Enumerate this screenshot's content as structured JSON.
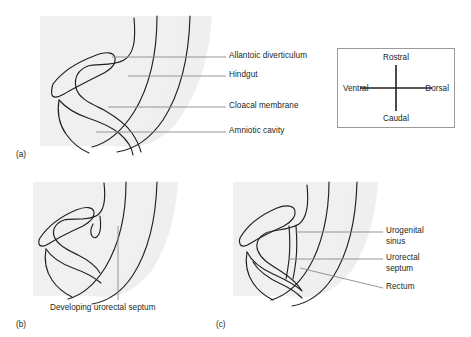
{
  "figure": {
    "type": "anatomical-diagram",
    "background_color": "#ffffff",
    "tissue_shade_color": "#f0f0f0",
    "outline_color": "#231f20",
    "leader_line_color": "#8a8a8a"
  },
  "panels": [
    {
      "id": "a",
      "id_label": "(a)",
      "labels": [
        {
          "text": "Allantoic diverticulum",
          "leader": "horizontal"
        },
        {
          "text": "Hindgut",
          "leader": "horizontal"
        },
        {
          "text": "Cloacal membrane",
          "leader": "horizontal"
        },
        {
          "text": "Amniotic cavity",
          "leader": "horizontal"
        }
      ]
    },
    {
      "id": "b",
      "id_label": "(b)",
      "labels": [
        {
          "text": "Developing urorectal septum",
          "leader": "vertical"
        }
      ]
    },
    {
      "id": "c",
      "id_label": "(c)",
      "labels": [
        {
          "text": "Urogenital",
          "text2": "sinus",
          "leader": "horizontal"
        },
        {
          "text": "Urorectal",
          "text2": "septum",
          "leader": "horizontal"
        },
        {
          "text": "Rectum",
          "leader": "slanted"
        }
      ]
    }
  ],
  "orientation_key": {
    "name": "orientation-compass",
    "rostral": "Rostral",
    "caudal": "Caudal",
    "ventral": "Ventral",
    "dorsal": "Dorsal",
    "border_color": "#9a9a9a"
  }
}
